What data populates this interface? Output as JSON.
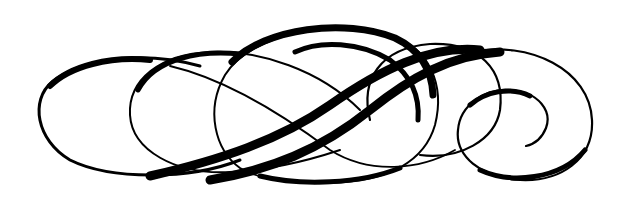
{
  "image": {
    "description": "Black calligraphic swirl flourish ornament on white background",
    "background_color": "#ffffff",
    "ink_color": "#000000",
    "width": 627,
    "height": 197
  },
  "ornament": {
    "name": "calligraphic-flourish",
    "elements": [
      "left-loop",
      "second-loop",
      "center-oval",
      "diagonal-swashes",
      "right-loop",
      "right-spiral"
    ]
  }
}
